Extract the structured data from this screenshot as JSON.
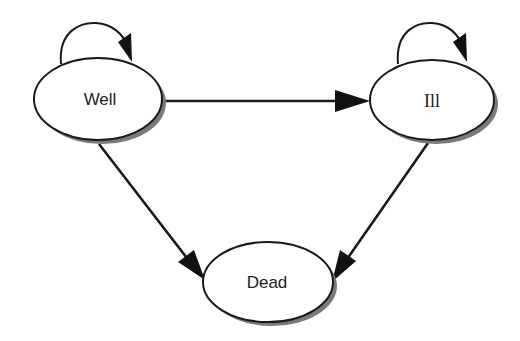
{
  "diagram": {
    "type": "state-transition",
    "nodes": [
      {
        "id": "well",
        "label": "Well"
      },
      {
        "id": "ill",
        "label": "Ill"
      },
      {
        "id": "dead",
        "label": "Dead"
      }
    ],
    "edges": [
      {
        "from": "well",
        "to": "well",
        "kind": "self-loop"
      },
      {
        "from": "ill",
        "to": "ill",
        "kind": "self-loop"
      },
      {
        "from": "well",
        "to": "ill",
        "kind": "transition"
      },
      {
        "from": "well",
        "to": "dead",
        "kind": "transition"
      },
      {
        "from": "ill",
        "to": "dead",
        "kind": "transition"
      }
    ],
    "colors": {
      "stroke": "#1a1a1a",
      "shadow": "#7a7a7a",
      "fill": "#ffffff",
      "background": "#ffffff"
    }
  }
}
